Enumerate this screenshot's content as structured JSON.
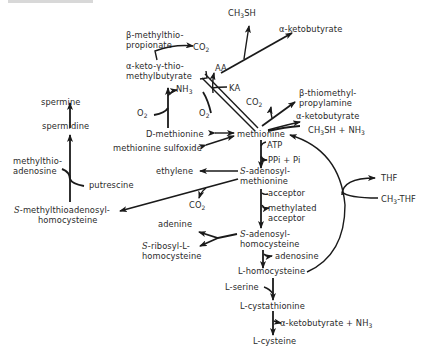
{
  "diagram": {
    "nodes": {
      "beta_methylthiopropionate_1": "β-methylthio-",
      "beta_methylthiopropionate_2": "propionate",
      "co2_top": "CO",
      "ch3sh_top": "CH",
      "ch3sh_top_suffix": "SH",
      "ketobutyrate_top": "α-ketobutyrate",
      "keto_thio_1": "α-keto-γ-thio-",
      "keto_thio_2": "methylbutyrate",
      "aa": "AA",
      "ka": "KA",
      "nh3_upper": "NH",
      "o2_left": "O",
      "o2_right": "O",
      "spermine": "spermine",
      "spermidine": "spermidine",
      "methylthioadenosine_1": "methylthio-",
      "methylthioadenosine_2": "adenosine",
      "putrescine": "putrescine",
      "smtah_prefix": "S",
      "smtah_1": "-methylthioadenosyl-",
      "smtah_2": "homocysteine",
      "d_methionine": "D-methionine",
      "methionine_sulfoxide": "methionine sulfoxide",
      "methionine": "methionine",
      "co2_right": "CO",
      "thiomethylpropylamine_1": "β-thiomethyl-",
      "thiomethylpropylamine_2": "propylamine",
      "ketobutyrate_mid": "α-ketobutyrate",
      "ch3sh_nh3": "CH",
      "ch3sh_nh3_suffix": "SH + NH",
      "atp": "ATP",
      "ppi_pi": "PPi + Pi",
      "sam_prefix": "S",
      "sam_1": "-adenosyl-",
      "sam_2": "methionine",
      "ethylene": "ethylene",
      "co2_lower": "CO",
      "acceptor": "acceptor",
      "methylated_acceptor_1": "methylated",
      "methylated_acceptor_2": "acceptor",
      "thf": "THF",
      "ch3_thf": "CH",
      "ch3_thf_suffix": "-THF",
      "adenine": "adenine",
      "ribosyl_prefix": "S",
      "ribosyl_1": "-ribosyl-L-",
      "ribosyl_2": "homocysteine",
      "sah_prefix": "S",
      "sah_1": "-adenosyl-",
      "sah_2": "homocysteine",
      "adenosine": "adenosine",
      "l_homocysteine": "L-homocysteine",
      "l_serine": "L-serine",
      "l_cystathionine": "L-cystathionine",
      "ketobutyrate_bottom": "α-ketobutyrate + NH",
      "l_cysteine": "L-cysteine"
    },
    "subscripts": {
      "two": "2",
      "three": "3"
    },
    "colors": {
      "line": "#1a1a1a",
      "text": "#2a2a2a",
      "background": "#ffffff"
    }
  }
}
